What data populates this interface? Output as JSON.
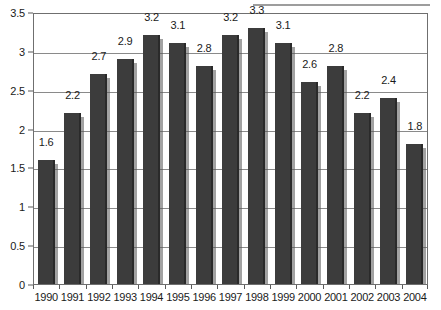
{
  "chart_data": {
    "type": "bar",
    "title": "",
    "subtitle": "",
    "xlabel": "",
    "ylabel": "",
    "categories": [
      "1990",
      "1991",
      "1992",
      "1993",
      "1994",
      "1995",
      "1996",
      "1997",
      "1998",
      "1999",
      "2000",
      "2001",
      "2002",
      "2003",
      "2004"
    ],
    "values": [
      1.6,
      2.2,
      2.7,
      2.9,
      3.2,
      3.1,
      2.8,
      3.2,
      3.3,
      3.1,
      2.6,
      2.8,
      2.2,
      2.4,
      1.8
    ],
    "data_labels": [
      "1.6",
      "2.2",
      "2.7",
      "2.9",
      "3.2",
      "3.1",
      "2.8",
      "3.2",
      "3.3",
      "3.1",
      "2.6",
      "2.8",
      "2.2",
      "2.4",
      "1.8"
    ],
    "ylim": [
      0,
      3.5
    ],
    "ytick_values": [
      0,
      0.5,
      1,
      1.5,
      2,
      2.5,
      3,
      3.5
    ],
    "ytick_labels": [
      "0",
      "0.5",
      "1",
      "1.5",
      "2",
      "2.5",
      "3",
      "3.5"
    ],
    "grid": true,
    "grid_orientation": "horizontal",
    "legend": false,
    "legend_position": "none",
    "series": [
      {
        "name": "Series 1",
        "values": [
          1.6,
          2.2,
          2.7,
          2.9,
          3.2,
          3.1,
          2.8,
          3.2,
          3.3,
          3.1,
          2.6,
          2.8,
          2.2,
          2.4,
          1.8
        ]
      }
    ]
  },
  "colors": {
    "bar_fill": "#3c3c3c",
    "bar_edge": "#2a2a2a",
    "bar_highlight": "#565656",
    "gridline": "#8a8a8a",
    "frame": "#6f6f6f",
    "text": "#1a1a1a",
    "plot_background": "#ffffff",
    "page_background": "#ffffff",
    "top_rule": "#8c8c8c"
  },
  "decorations": {
    "top_rule_present": true
  }
}
